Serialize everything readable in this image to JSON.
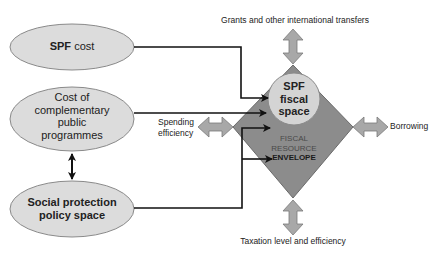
{
  "diagram": {
    "nodes": {
      "spf_cost": {
        "bold": "SPF",
        "rest": " cost"
      },
      "complementary": {
        "line1": "Cost of",
        "line2": "complementary",
        "line3": "public",
        "line4": "programmes"
      },
      "policy_space": {
        "line1": "Social protection",
        "line2": "policy space"
      },
      "fiscal_space": {
        "line1": "SPF",
        "line2": "fiscal",
        "line3": "space"
      },
      "envelope": {
        "line1": "FISCAL",
        "line2": "RESOURCE",
        "line3": "ENVELOPE"
      }
    },
    "levers": {
      "top": "Grants and other international transfers",
      "right": "Borrowing",
      "left_line1": "Spending",
      "left_line2": "efficiency",
      "bottom": "Taxation level and efficiency"
    },
    "colors": {
      "ellipse_fill": "#dcdcdc",
      "ellipse_stroke": "#8a8a8a",
      "diamond_fill": "#8c8c8c",
      "circle_fill": "#d4d4d4",
      "arrow_fill": "#a8a8a8",
      "line": "#111111"
    }
  }
}
